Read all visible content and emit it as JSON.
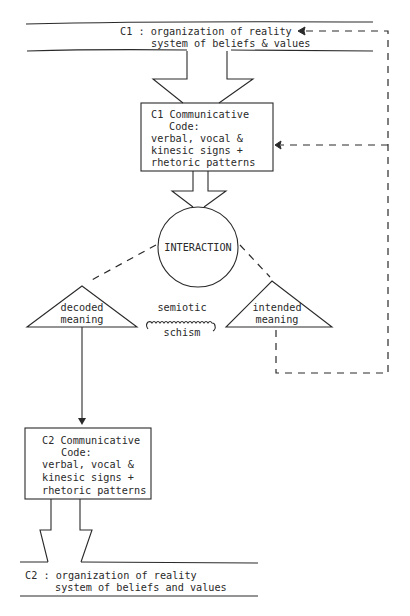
{
  "diagram": {
    "c1_culture": {
      "line1": "C1 : organization of reality",
      "line2": "system of beliefs & values"
    },
    "c1_code_box": {
      "line1": "C1 Communicative",
      "line2": "Code:",
      "line3": "verbal, vocal &",
      "line4": "kinesic signs +",
      "line5": "rhetoric patterns"
    },
    "interaction": {
      "label": "INTERACTION"
    },
    "decoded_meaning": {
      "line1": "decoded",
      "line2": "meaning"
    },
    "intended_meaning": {
      "line1": "intended",
      "line2": "meaning"
    },
    "schism": {
      "line1": "semiotic",
      "line2": "schism"
    },
    "c2_code_box": {
      "line1": "C2 Communicative",
      "line2": "Code:",
      "line3": "verbal, vocal &",
      "line4": "kinesic signs +",
      "line5": "rhetoric patterns"
    },
    "c2_culture": {
      "line1": "C2 : organization of reality",
      "line2": "system of beliefs and values"
    },
    "edges": [
      {
        "from": "C1 culture",
        "to": "C1 communicative code",
        "style": "block-arrow"
      },
      {
        "from": "C1 communicative code",
        "to": "INTERACTION",
        "style": "block-arrow"
      },
      {
        "from": "INTERACTION",
        "to": "decoded meaning",
        "style": "dashed"
      },
      {
        "from": "INTERACTION",
        "to": "intended meaning",
        "style": "dashed"
      },
      {
        "from": "decoded meaning",
        "to": "intended meaning",
        "style": "wavy",
        "label": "semiotic schism"
      },
      {
        "from": "decoded meaning",
        "to": "C2 communicative code",
        "style": "solid-arrow"
      },
      {
        "from": "intended meaning",
        "to": "C1 culture",
        "style": "dashed-arrow"
      },
      {
        "from": "intended meaning",
        "to": "C1 communicative code",
        "style": "dashed-arrow"
      },
      {
        "from": "C2 communicative code",
        "to": "C2 culture",
        "style": "block-arrow"
      }
    ],
    "colors": {
      "ink": "#2a2a2a",
      "paper": "#ffffff"
    }
  }
}
